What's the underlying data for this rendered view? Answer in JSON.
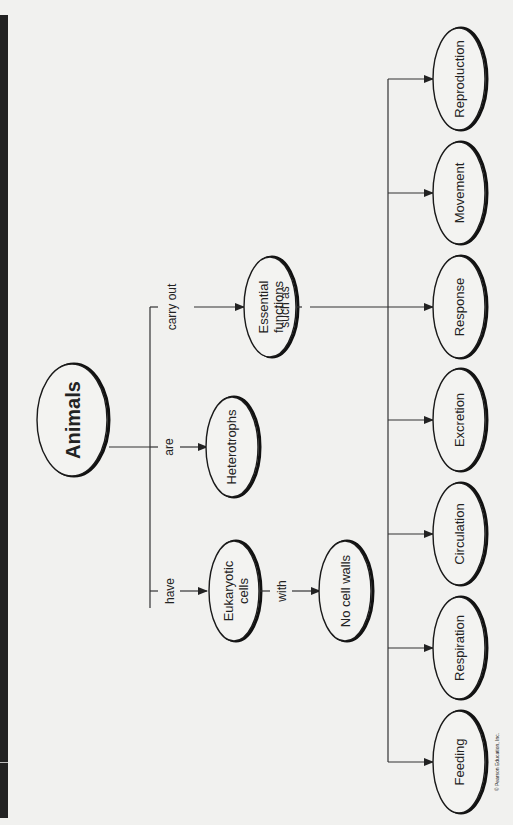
{
  "diagram": {
    "type": "concept-map",
    "orientation": "rotated-90-ccw",
    "root": {
      "label": "Animals"
    },
    "links": {
      "carry_out": "carry out",
      "are": "are",
      "have": "have",
      "with": "with",
      "such_as": "such as"
    },
    "nodes": {
      "essential_functions": {
        "line1": "Essential",
        "line2": "functions"
      },
      "heterotrophs": {
        "label": "Heterotrophs"
      },
      "eukaryotic_cells": {
        "line1": "Eukaryotic",
        "line2": "cells"
      },
      "no_cell_walls": {
        "label": "No cell walls"
      }
    },
    "functions": [
      {
        "label": "Reproduction"
      },
      {
        "label": "Movement"
      },
      {
        "label": "Response"
      },
      {
        "label": "Excretion"
      },
      {
        "label": "Circulation"
      },
      {
        "label": "Respiration"
      },
      {
        "label": "Feeding"
      }
    ],
    "copyright": "© Pearson Education, Inc."
  },
  "colors": {
    "background": "#f1f1ef",
    "sidebar": "#222222",
    "stroke": "#1a1a1a"
  }
}
